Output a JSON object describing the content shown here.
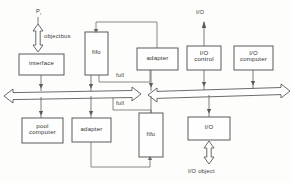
{
  "diagram": {
    "stroke_color": "#5a5a5a",
    "fill_color": "#fefefe",
    "text_color": "#333333",
    "boxes": [
      {
        "id": "interface",
        "label": "interface",
        "x": 19,
        "y": 54,
        "w": 45,
        "h": 21
      },
      {
        "id": "fifo-top",
        "label": "fifo",
        "x": 85,
        "y": 32,
        "w": 23,
        "h": 43
      },
      {
        "id": "adapter-top",
        "label": "adapter",
        "x": 137,
        "y": 48,
        "w": 41,
        "h": 22
      },
      {
        "id": "io-control",
        "label": "I/O\ncontrol",
        "x": 187,
        "y": 46,
        "w": 34,
        "h": 24
      },
      {
        "id": "io-computer",
        "label": "I/O\ncomputer",
        "x": 234,
        "y": 46,
        "w": 39,
        "h": 24
      },
      {
        "id": "pool-computer",
        "label": "pool\ncomputer",
        "x": 22,
        "y": 118,
        "w": 41,
        "h": 25
      },
      {
        "id": "adapter-bot",
        "label": "adapter",
        "x": 72,
        "y": 118,
        "w": 39,
        "h": 24
      },
      {
        "id": "fifo-bot",
        "label": "fifo",
        "x": 139,
        "y": 113,
        "w": 24,
        "h": 44
      },
      {
        "id": "io-box",
        "label": "I/O",
        "x": 188,
        "y": 117,
        "w": 42,
        "h": 23
      }
    ],
    "labels": [
      {
        "id": "pi-label",
        "text": "P",
        "sub": "i",
        "x": 37,
        "y": 12
      },
      {
        "id": "objectbus-label",
        "text": "objectbus",
        "x": 44,
        "y": 36
      },
      {
        "id": "full-upper",
        "text": "full",
        "x": 116,
        "y": 75
      },
      {
        "id": "full-lower",
        "text": "full",
        "x": 116,
        "y": 103
      },
      {
        "id": "io-top-label",
        "text": "I/O",
        "x": 197,
        "y": 12
      },
      {
        "id": "io-object-label",
        "text": "I/O object",
        "x": 189,
        "y": 169
      }
    ],
    "buses": [
      {
        "id": "objectbus-left",
        "label": "left objectbus double arrow"
      },
      {
        "id": "objectbus-right",
        "label": "right objectbus double arrow"
      }
    ]
  }
}
